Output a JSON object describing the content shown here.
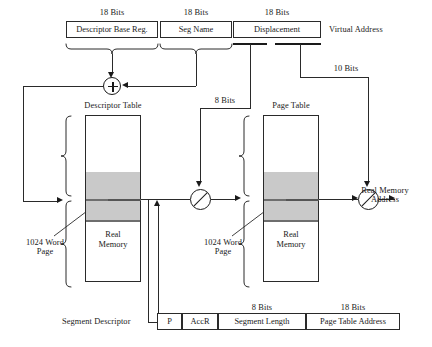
{
  "figure": {
    "colors": {
      "line": "#1a1a1a",
      "box_border": "#2a2a2a",
      "page_band": "#c9c9c9",
      "band_line": "#6e6e6e",
      "background": "#ffffff"
    }
  },
  "virtual_address": {
    "trailing_label": "Virtual Address",
    "fields": [
      {
        "name": "descriptor-base-reg",
        "label": "Descriptor Base Reg.",
        "bits": "18 Bits"
      },
      {
        "name": "seg-name",
        "label": "Seg Name",
        "bits": "18 Bits"
      },
      {
        "name": "displacement",
        "label": "Displacement",
        "bits": "18 Bits"
      }
    ]
  },
  "operators": {
    "adder_symbol": "+",
    "concat_symbol": "/"
  },
  "bit_widths": {
    "page_index": "10 Bits",
    "segment_index": "8 Bits"
  },
  "tables": [
    {
      "name": "descriptor-table",
      "title": "Descriptor Table",
      "memory_label_line1": "Real",
      "memory_label_line2": "Memory",
      "page_callout_line1": "1024 Word",
      "page_callout_line2": "Page"
    },
    {
      "name": "page-table",
      "title": "Page Table",
      "memory_label_line1": "Real",
      "memory_label_line2": "Memory",
      "page_callout_line1": "1024 Word",
      "page_callout_line2": "Page"
    }
  ],
  "output": {
    "label_line1": "Real Memory",
    "label_line2": "Address"
  },
  "segment_descriptor": {
    "row_label": "Segment Descriptor",
    "cells": [
      {
        "name": "presence-bit",
        "label": "P",
        "bits": ""
      },
      {
        "name": "access-rights",
        "label": "AccR",
        "bits": ""
      },
      {
        "name": "segment-length",
        "label": "Segment Length",
        "bits": "8 Bits"
      },
      {
        "name": "page-table-address",
        "label": "Page Table Address",
        "bits": "18 Bits"
      }
    ]
  }
}
